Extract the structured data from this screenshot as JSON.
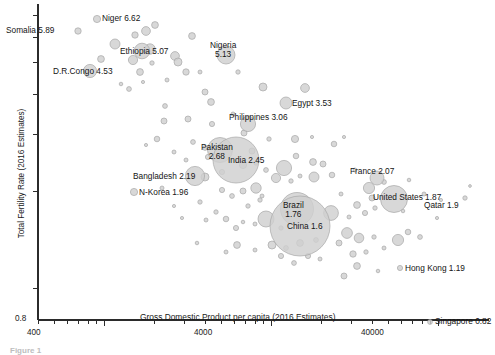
{
  "chart_data": {
    "type": "scatter",
    "title": "",
    "xlabel": "Gross Domestic Product per capita (2016 Estimates)",
    "ylabel": "Total Fertility Rate (2016 Estimates)",
    "xscale": "log",
    "yscale": "log",
    "xlim": [
      400,
      140000
    ],
    "ylim": [
      0.8,
      7.6
    ],
    "grid": false,
    "legend": null,
    "xticklabels": [
      "400",
      "4000",
      "40000"
    ],
    "xtickvalues": [
      400,
      4000,
      40000
    ],
    "yticklabels": [
      "0.8"
    ],
    "ytickvalues": [
      0.8
    ],
    "bubble_size_note": "Bubble area proportional to population",
    "labeled_points": [
      {
        "name": "Niger",
        "label": "Niger 6.62",
        "fertility": 6.62,
        "gdp_pc": 1100,
        "px": 97,
        "py": 19,
        "r": 3.6,
        "label_dx": 5,
        "label_dy": -5,
        "lines": [
          "Niger 6.62"
        ]
      },
      {
        "name": "Somalia",
        "label": "Somalia 5.89",
        "fertility": 5.89,
        "gdp_pc": 620,
        "px": 78,
        "py": 31,
        "r": 3.2,
        "label_dx": -72,
        "label_dy": -5,
        "lines": [
          "Somalia 5.89"
        ]
      },
      {
        "name": "Ethiopia",
        "label": "Ethiopia 5.07",
        "fertility": 5.07,
        "gdp_pc": 1850,
        "px": 142,
        "py": 51,
        "r": 7.8,
        "label_dx": -22,
        "label_dy": -4,
        "lines": [
          "Ethiopia 5.07"
        ]
      },
      {
        "name": "Nigeria",
        "label": "Nigeria 5.13",
        "fertility": 5.13,
        "gdp_pc": 5900,
        "px": 226,
        "py": 55,
        "r": 9.0,
        "label_dx": -16,
        "label_dy": -14,
        "lines": [
          "Nigeria",
          "5.13"
        ]
      },
      {
        "name": "D.R.Congo",
        "label": "D.R.Congo 4.53",
        "fertility": 4.53,
        "gdp_pc": 800,
        "px": 90,
        "py": 71,
        "r": 6.6,
        "label_dx": -37,
        "label_dy": -4,
        "lines": [
          "D.R.Congo 4.53"
        ]
      },
      {
        "name": "Egypt",
        "label": "Egypt 3.53",
        "fertility": 3.53,
        "gdp_pc": 12600,
        "px": 286,
        "py": 103,
        "r": 6.0,
        "label_dx": 6,
        "label_dy": -4,
        "lines": [
          "Egypt 3.53"
        ]
      },
      {
        "name": "Philippines",
        "label": "Philippines 3.06",
        "fertility": 3.06,
        "gdp_pc": 7800,
        "px": 248,
        "py": 124,
        "r": 7.6,
        "label_dx": -19,
        "label_dy": -11,
        "lines": [
          "Philippines 3.06"
        ]
      },
      {
        "name": "Pakistan",
        "label": "Pakistan 2.68",
        "fertility": 2.68,
        "gdp_pc": 5200,
        "px": 220,
        "py": 150,
        "r": 12.5,
        "label_dx": -19,
        "label_dy": -7,
        "lines": [
          "Pakistan",
          "2.68"
        ]
      },
      {
        "name": "India",
        "label": "India 2.45",
        "fertility": 2.45,
        "gdp_pc": 6600,
        "px": 236,
        "py": 160,
        "r": 23.0,
        "label_dx": -8,
        "label_dy": -4,
        "lines": [
          "India 2.45"
        ]
      },
      {
        "name": "Bangladesh",
        "label": "Bangladesh 2.19",
        "fertility": 2.19,
        "gdp_pc": 3900,
        "px": 195,
        "py": 176,
        "r": 9.6,
        "label_dx": -62,
        "label_dy": -4,
        "lines": [
          "Bangladesh 2.19"
        ]
      },
      {
        "name": "N-Korea",
        "label": "N-Korea 1.96",
        "fertility": 1.96,
        "gdp_pc": 1700,
        "px": 134,
        "py": 192,
        "r": 3.6,
        "label_dx": 5,
        "label_dy": -4,
        "lines": [
          "N-Korea 1.96"
        ]
      },
      {
        "name": "France",
        "label": "France 2.07",
        "fertility": 2.07,
        "gdp_pc": 42500,
        "px": 377,
        "py": 178,
        "r": 7.0,
        "label_dx": -27,
        "label_dy": -11,
        "lines": [
          "France 2.07"
        ]
      },
      {
        "name": "United States",
        "label": "United States 1.87",
        "fertility": 1.87,
        "gdp_pc": 57600,
        "px": 394,
        "py": 199,
        "r": 13.5,
        "label_dx": -21,
        "label_dy": -6,
        "lines": [
          "United States 1.87"
        ]
      },
      {
        "name": "Qatar",
        "label": "Qatar 1.9",
        "fertility": 1.9,
        "gdp_pc": 128000,
        "px": 465,
        "py": 198,
        "r": 2.2,
        "label_dx": -41,
        "label_dy": 3,
        "lines": [
          "Qatar 1.9"
        ]
      },
      {
        "name": "Brazil",
        "label": "Brazil 1.76",
        "fertility": 1.76,
        "gdp_pc": 15200,
        "px": 297,
        "py": 209,
        "r": 16.5,
        "label_dx": -14,
        "label_dy": -8,
        "lines": [
          "Brazil",
          "1.76"
        ]
      },
      {
        "name": "China",
        "label": "China 1.6",
        "fertility": 1.6,
        "gdp_pc": 15400,
        "px": 300,
        "py": 226,
        "r": 30.0,
        "label_dx": -13,
        "label_dy": -4,
        "lines": [
          "China 1.6"
        ]
      },
      {
        "name": "Hong Kong",
        "label": "Hong Kong 1.19",
        "fertility": 1.19,
        "gdp_pc": 58000,
        "px": 400,
        "py": 268,
        "r": 2.6,
        "label_dx": 5,
        "label_dy": -4,
        "lines": [
          "Hong Kong 1.19"
        ]
      },
      {
        "name": "Singapore",
        "label": "Singapore 0.82",
        "fertility": 0.82,
        "gdp_pc": 87800,
        "px": 430,
        "py": 322,
        "r": 2.4,
        "label_dx": 5,
        "label_dy": -5,
        "lines": [
          "Singapore 0.82"
        ]
      }
    ],
    "unlabeled_points": [
      {
        "px": 115,
        "py": 44,
        "r": 5.0
      },
      {
        "px": 101,
        "py": 59,
        "r": 3.4
      },
      {
        "px": 135,
        "py": 35,
        "r": 3.2
      },
      {
        "px": 146,
        "py": 31,
        "r": 4.4
      },
      {
        "px": 155,
        "py": 25,
        "r": 3.4
      },
      {
        "px": 133,
        "py": 60,
        "r": 4.6
      },
      {
        "px": 150,
        "py": 49,
        "r": 5.2
      },
      {
        "px": 152,
        "py": 63,
        "r": 2.2
      },
      {
        "px": 175,
        "py": 56,
        "r": 4.4
      },
      {
        "px": 178,
        "py": 62,
        "r": 4.0
      },
      {
        "px": 192,
        "py": 36,
        "r": 3.4
      },
      {
        "px": 200,
        "py": 72,
        "r": 2.0
      },
      {
        "px": 238,
        "py": 72,
        "r": 2.2
      },
      {
        "px": 121,
        "py": 84,
        "r": 1.8
      },
      {
        "px": 129,
        "py": 89,
        "r": 2.4
      },
      {
        "px": 140,
        "py": 72,
        "r": 3.4
      },
      {
        "px": 143,
        "py": 82,
        "r": 1.6
      },
      {
        "px": 167,
        "py": 80,
        "r": 2.0
      },
      {
        "px": 165,
        "py": 106,
        "r": 2.4
      },
      {
        "px": 186,
        "py": 72,
        "r": 3.2
      },
      {
        "px": 164,
        "py": 121,
        "r": 3.0
      },
      {
        "px": 205,
        "py": 92,
        "r": 3.0
      },
      {
        "px": 211,
        "py": 102,
        "r": 3.4
      },
      {
        "px": 263,
        "py": 87,
        "r": 4.0
      },
      {
        "px": 305,
        "py": 88,
        "r": 4.4
      },
      {
        "px": 157,
        "py": 139,
        "r": 2.8
      },
      {
        "px": 146,
        "py": 145,
        "r": 1.6
      },
      {
        "px": 188,
        "py": 119,
        "r": 3.0
      },
      {
        "px": 193,
        "py": 142,
        "r": 2.4
      },
      {
        "px": 205,
        "py": 148,
        "r": 2.4
      },
      {
        "px": 208,
        "py": 157,
        "r": 2.6
      },
      {
        "px": 186,
        "py": 160,
        "r": 2.0
      },
      {
        "px": 174,
        "py": 152,
        "r": 2.0
      },
      {
        "px": 244,
        "py": 133,
        "r": 3.0
      },
      {
        "px": 269,
        "py": 139,
        "r": 2.2
      },
      {
        "px": 295,
        "py": 139,
        "r": 3.6
      },
      {
        "px": 312,
        "py": 137,
        "r": 1.6
      },
      {
        "px": 334,
        "py": 144,
        "r": 2.8
      },
      {
        "px": 344,
        "py": 137,
        "r": 1.6
      },
      {
        "px": 296,
        "py": 156,
        "r": 2.8
      },
      {
        "px": 313,
        "py": 162,
        "r": 3.4
      },
      {
        "px": 323,
        "py": 164,
        "r": 3.0
      },
      {
        "px": 284,
        "py": 168,
        "r": 7.6
      },
      {
        "px": 266,
        "py": 170,
        "r": 2.4
      },
      {
        "px": 256,
        "py": 163,
        "r": 2.2
      },
      {
        "px": 276,
        "py": 178,
        "r": 4.6
      },
      {
        "px": 291,
        "py": 181,
        "r": 2.2
      },
      {
        "px": 300,
        "py": 176,
        "r": 2.0
      },
      {
        "px": 314,
        "py": 177,
        "r": 5.0
      },
      {
        "px": 332,
        "py": 175,
        "r": 2.8
      },
      {
        "px": 355,
        "py": 170,
        "r": 2.0
      },
      {
        "px": 369,
        "py": 188,
        "r": 5.6
      },
      {
        "px": 384,
        "py": 182,
        "r": 2.4
      },
      {
        "px": 409,
        "py": 180,
        "r": 1.8
      },
      {
        "px": 424,
        "py": 194,
        "r": 2.0
      },
      {
        "px": 441,
        "py": 200,
        "r": 1.6
      },
      {
        "px": 470,
        "py": 186,
        "r": 1.4
      },
      {
        "px": 256,
        "py": 188,
        "r": 5.2
      },
      {
        "px": 243,
        "py": 191,
        "r": 3.0
      },
      {
        "px": 232,
        "py": 196,
        "r": 2.4
      },
      {
        "px": 222,
        "py": 190,
        "r": 2.6
      },
      {
        "px": 248,
        "py": 206,
        "r": 2.2
      },
      {
        "px": 260,
        "py": 200,
        "r": 2.2
      },
      {
        "px": 341,
        "py": 194,
        "r": 2.0
      },
      {
        "px": 357,
        "py": 205,
        "r": 3.4
      },
      {
        "px": 365,
        "py": 213,
        "r": 2.6
      },
      {
        "px": 375,
        "py": 208,
        "r": 2.2
      },
      {
        "px": 372,
        "py": 198,
        "r": 3.0
      },
      {
        "px": 403,
        "py": 211,
        "r": 1.8
      },
      {
        "px": 437,
        "py": 218,
        "r": 1.6
      },
      {
        "px": 331,
        "py": 213,
        "r": 7.4
      },
      {
        "px": 349,
        "py": 217,
        "r": 2.0
      },
      {
        "px": 200,
        "py": 202,
        "r": 2.2
      },
      {
        "px": 216,
        "py": 212,
        "r": 2.2
      },
      {
        "px": 206,
        "py": 220,
        "r": 2.0
      },
      {
        "px": 226,
        "py": 219,
        "r": 2.8
      },
      {
        "px": 236,
        "py": 228,
        "r": 2.6
      },
      {
        "px": 243,
        "py": 222,
        "r": 1.8
      },
      {
        "px": 255,
        "py": 224,
        "r": 2.0
      },
      {
        "px": 266,
        "py": 219,
        "r": 8.0
      },
      {
        "px": 281,
        "py": 228,
        "r": 2.2
      },
      {
        "px": 347,
        "py": 233,
        "r": 5.4
      },
      {
        "px": 359,
        "py": 238,
        "r": 4.8
      },
      {
        "px": 339,
        "py": 243,
        "r": 3.0
      },
      {
        "px": 374,
        "py": 237,
        "r": 2.2
      },
      {
        "px": 398,
        "py": 240,
        "r": 5.6
      },
      {
        "px": 408,
        "py": 232,
        "r": 2.8
      },
      {
        "px": 420,
        "py": 237,
        "r": 2.4
      },
      {
        "px": 300,
        "py": 243,
        "r": 3.4
      },
      {
        "px": 316,
        "py": 240,
        "r": 2.4
      },
      {
        "px": 286,
        "py": 248,
        "r": 2.4
      },
      {
        "px": 272,
        "py": 245,
        "r": 4.0
      },
      {
        "px": 255,
        "py": 250,
        "r": 2.0
      },
      {
        "px": 237,
        "py": 245,
        "r": 3.4
      },
      {
        "px": 226,
        "py": 252,
        "r": 2.0
      },
      {
        "px": 281,
        "py": 256,
        "r": 2.6
      },
      {
        "px": 294,
        "py": 263,
        "r": 2.4
      },
      {
        "px": 308,
        "py": 256,
        "r": 2.6
      },
      {
        "px": 320,
        "py": 259,
        "r": 2.0
      },
      {
        "px": 353,
        "py": 254,
        "r": 3.2
      },
      {
        "px": 366,
        "py": 252,
        "r": 2.2
      },
      {
        "px": 384,
        "py": 248,
        "r": 2.0
      },
      {
        "px": 357,
        "py": 266,
        "r": 3.4
      },
      {
        "px": 378,
        "py": 271,
        "r": 1.8
      },
      {
        "px": 344,
        "py": 276,
        "r": 3.0
      },
      {
        "px": 197,
        "py": 243,
        "r": 1.8
      },
      {
        "px": 182,
        "py": 218,
        "r": 1.6
      },
      {
        "px": 174,
        "py": 206,
        "r": 1.6
      },
      {
        "px": 162,
        "py": 188,
        "r": 2.0
      },
      {
        "px": 205,
        "py": 177,
        "r": 4.0
      },
      {
        "px": 222,
        "py": 172,
        "r": 2.6
      },
      {
        "px": 252,
        "py": 151,
        "r": 3.0
      },
      {
        "px": 262,
        "py": 196,
        "r": 2.0
      },
      {
        "px": 212,
        "py": 124,
        "r": 2.6
      },
      {
        "px": 233,
        "py": 114,
        "r": 2.0
      },
      {
        "px": 243,
        "py": 165,
        "r": 3.6
      }
    ]
  },
  "caption": "Figure 1"
}
